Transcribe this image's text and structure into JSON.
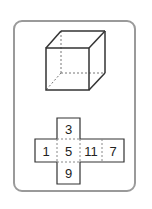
{
  "figure": {
    "type": "cube-and-net",
    "cube": {
      "description": "wireframe cube with hidden edges dashed"
    },
    "net": {
      "layout": "cross",
      "cells": [
        {
          "position": "top",
          "label": "3"
        },
        {
          "position": "left",
          "label": "1"
        },
        {
          "position": "center",
          "label": "5"
        },
        {
          "position": "right",
          "label": "11"
        },
        {
          "position": "far-right",
          "label": "7"
        },
        {
          "position": "bottom",
          "label": "9"
        }
      ]
    }
  }
}
